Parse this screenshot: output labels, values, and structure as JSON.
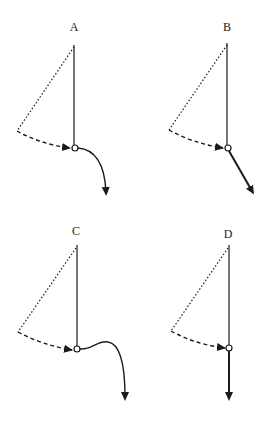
{
  "figure": {
    "panels": [
      {
        "id": "A",
        "label": "A",
        "trajectory": "curved-right-then-down"
      },
      {
        "id": "B",
        "label": "B",
        "trajectory": "straight-diagonal"
      },
      {
        "id": "C",
        "label": "C",
        "trajectory": "wavy-right-then-down"
      },
      {
        "id": "D",
        "label": "D",
        "trajectory": "straight-down"
      }
    ],
    "colors": {
      "stroke": "#1a1a1a",
      "background": "#ffffff"
    }
  }
}
